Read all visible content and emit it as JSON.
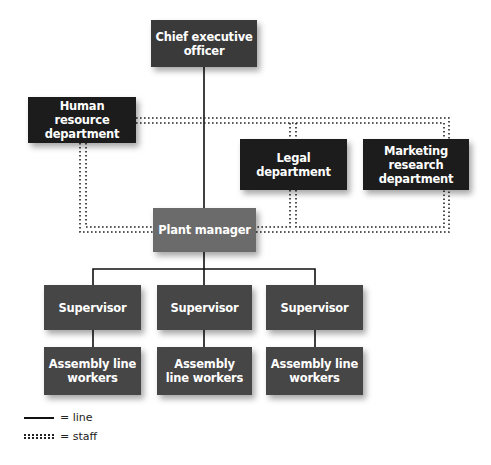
{
  "diagram": {
    "type": "organization-chart",
    "colors": {
      "executive": "#3a3a3a",
      "staff_department": "#1c1c1c",
      "plant_manager": "#6b6b6b",
      "line_unit": "#464646",
      "line": "#111111",
      "text": "#ffffff"
    },
    "nodes": {
      "ceo": {
        "label": "Chief executive officer"
      },
      "hr": {
        "label": "Human resource department"
      },
      "legal": {
        "label": "Legal department"
      },
      "marketing": {
        "label": "Marketing research department"
      },
      "plant_manager": {
        "label": "Plant manager"
      },
      "supervisors": [
        {
          "label": "Supervisor"
        },
        {
          "label": "Supervisor"
        },
        {
          "label": "Supervisor"
        }
      ],
      "workers": [
        {
          "label": "Assembly line workers"
        },
        {
          "label": "Assembly line workers"
        },
        {
          "label": "Assembly line workers"
        }
      ]
    },
    "edges": [
      {
        "from": "ceo",
        "to": "plant_manager",
        "type": "line"
      },
      {
        "from": "plant_manager",
        "to": "supervisor_1",
        "type": "line"
      },
      {
        "from": "plant_manager",
        "to": "supervisor_2",
        "type": "line"
      },
      {
        "from": "plant_manager",
        "to": "supervisor_3",
        "type": "line"
      },
      {
        "from": "supervisor_1",
        "to": "workers_1",
        "type": "line"
      },
      {
        "from": "supervisor_2",
        "to": "workers_2",
        "type": "line"
      },
      {
        "from": "supervisor_3",
        "to": "workers_3",
        "type": "line"
      },
      {
        "from": "hr",
        "to": "legal",
        "type": "staff"
      },
      {
        "from": "hr",
        "to": "marketing",
        "type": "staff"
      },
      {
        "from": "hr",
        "to": "plant_manager",
        "type": "staff"
      },
      {
        "from": "legal",
        "to": "plant_manager",
        "type": "staff"
      },
      {
        "from": "marketing",
        "to": "plant_manager",
        "type": "staff"
      }
    ],
    "legend": {
      "line_label": "= line",
      "staff_label": "= staff"
    }
  }
}
